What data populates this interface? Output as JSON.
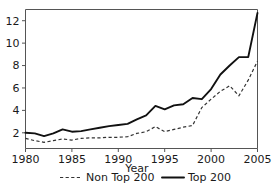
{
  "chart_data": {
    "type": "line",
    "title": "",
    "xlabel": "Year",
    "ylabel": "",
    "xlim": [
      1980,
      2005
    ],
    "ylim": [
      0.6,
      13.0
    ],
    "grid": false,
    "legend_position": "below",
    "x": [
      1980,
      1981,
      1982,
      1983,
      1984,
      1985,
      1986,
      1987,
      1988,
      1989,
      1990,
      1991,
      1992,
      1993,
      1994,
      1995,
      1996,
      1997,
      1998,
      1999,
      2000,
      2001,
      2002,
      2003,
      2004,
      2005
    ],
    "xticks": [
      1980,
      1985,
      1990,
      1995,
      2000,
      2005
    ],
    "xtick_labels": [
      "1980",
      "1985",
      "1990",
      "1995",
      "2000",
      "2005"
    ],
    "yticks": [
      2,
      4,
      6,
      8,
      10,
      12
    ],
    "ytick_labels": [
      "2",
      "4",
      "6",
      "8",
      "10",
      "12"
    ],
    "series": [
      {
        "name": "Non Top 200",
        "style": "dashed",
        "color": "#333333",
        "values": [
          1.5,
          1.3,
          1.15,
          1.3,
          1.45,
          1.35,
          1.5,
          1.55,
          1.55,
          1.6,
          1.6,
          1.65,
          1.95,
          2.1,
          2.55,
          2.1,
          2.3,
          2.5,
          2.65,
          4.25,
          5.0,
          5.7,
          6.2,
          5.3,
          6.7,
          8.4
        ]
      },
      {
        "name": "Top 200",
        "style": "solid",
        "color": "#111111",
        "values": [
          2.0,
          1.95,
          1.7,
          1.95,
          2.3,
          2.1,
          2.15,
          2.3,
          2.45,
          2.6,
          2.7,
          2.8,
          3.2,
          3.55,
          4.4,
          4.1,
          4.45,
          4.55,
          5.1,
          5.0,
          5.9,
          7.2,
          8.0,
          8.75,
          8.75,
          12.7
        ]
      }
    ],
    "legend": [
      {
        "label": "Non Top 200",
        "style": "dashed"
      },
      {
        "label": "Top 200",
        "style": "solid"
      }
    ]
  }
}
